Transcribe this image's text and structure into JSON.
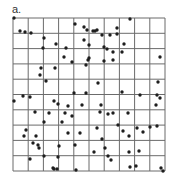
{
  "panel": {
    "label": "a."
  },
  "colors": {
    "grid": "#6b6b6b",
    "dot": "#1e1e1e",
    "background": "#ffffff"
  },
  "chart_data": {
    "type": "scatter",
    "title": "",
    "xlabel": "",
    "ylabel": "",
    "grid": true,
    "grid_divisions": 10,
    "xlim": [
      0,
      10
    ],
    "ylim": [
      0,
      10
    ],
    "plot_box_px": {
      "left": 13,
      "top": 18,
      "right": 165,
      "bottom": 171
    },
    "points_px": [
      [
        14,
        18
      ],
      [
        20,
        31
      ],
      [
        25,
        32
      ],
      [
        31,
        33
      ],
      [
        44,
        38
      ],
      [
        43,
        48
      ],
      [
        56,
        44
      ],
      [
        66,
        48
      ],
      [
        64,
        57
      ],
      [
        75,
        24
      ],
      [
        84,
        27
      ],
      [
        87,
        30
      ],
      [
        84,
        40
      ],
      [
        88,
        60
      ],
      [
        93,
        31
      ],
      [
        95,
        31
      ],
      [
        97,
        30
      ],
      [
        102,
        35
      ],
      [
        110,
        35
      ],
      [
        130,
        19
      ],
      [
        117,
        28
      ],
      [
        117,
        34
      ],
      [
        124,
        44
      ],
      [
        89,
        45
      ],
      [
        122,
        52
      ],
      [
        104,
        47
      ],
      [
        107,
        49
      ],
      [
        113,
        52
      ],
      [
        104,
        61
      ],
      [
        113,
        60
      ],
      [
        160,
        57
      ],
      [
        89,
        58
      ],
      [
        41,
        68
      ],
      [
        40,
        75
      ],
      [
        55,
        68
      ],
      [
        72,
        62
      ],
      [
        86,
        65
      ],
      [
        46,
        81
      ],
      [
        23,
        96
      ],
      [
        14,
        101
      ],
      [
        30,
        97
      ],
      [
        54,
        101
      ],
      [
        74,
        93
      ],
      [
        86,
        93
      ],
      [
        58,
        104
      ],
      [
        82,
        105
      ],
      [
        68,
        106
      ],
      [
        35,
        112
      ],
      [
        98,
        83
      ],
      [
        122,
        92
      ],
      [
        140,
        95
      ],
      [
        158,
        82
      ],
      [
        157,
        95
      ],
      [
        160,
        98
      ],
      [
        156,
        105
      ],
      [
        101,
        105
      ],
      [
        49,
        113
      ],
      [
        65,
        113
      ],
      [
        72,
        116
      ],
      [
        44,
        122
      ],
      [
        62,
        122
      ],
      [
        26,
        130
      ],
      [
        24,
        136
      ],
      [
        36,
        136
      ],
      [
        33,
        143
      ],
      [
        38,
        145
      ],
      [
        39,
        148
      ],
      [
        68,
        133
      ],
      [
        80,
        133
      ],
      [
        75,
        145
      ],
      [
        59,
        146
      ],
      [
        44,
        156
      ],
      [
        30,
        159
      ],
      [
        58,
        157
      ],
      [
        53,
        168
      ],
      [
        54,
        169
      ],
      [
        57,
        169
      ],
      [
        76,
        170
      ],
      [
        100,
        112
      ],
      [
        108,
        114
      ],
      [
        113,
        113
      ],
      [
        128,
        113
      ],
      [
        118,
        125
      ],
      [
        97,
        128
      ],
      [
        123,
        131
      ],
      [
        129,
        136
      ],
      [
        137,
        128
      ],
      [
        143,
        132
      ],
      [
        150,
        127
      ],
      [
        157,
        126
      ],
      [
        102,
        139
      ],
      [
        94,
        152
      ],
      [
        105,
        148
      ],
      [
        108,
        156
      ],
      [
        111,
        160
      ],
      [
        129,
        152
      ],
      [
        139,
        151
      ],
      [
        130,
        167
      ],
      [
        136,
        166
      ],
      [
        161,
        168
      ],
      [
        163,
        171
      ]
    ]
  }
}
